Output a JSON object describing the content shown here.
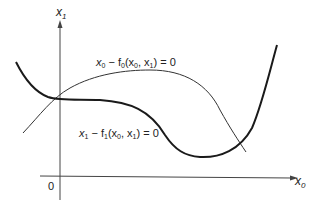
{
  "diagram": {
    "axes": {
      "y_label": "x",
      "y_label_sub": "1",
      "x_label": "x",
      "x_label_sub": "0",
      "origin_label": "0"
    },
    "curves": [
      {
        "name": "f0-curve",
        "style": "thin",
        "label_parts": [
          "x",
          "0",
          " − f",
          "0",
          "(x",
          "0",
          ", x",
          "1",
          ") = 0"
        ]
      },
      {
        "name": "f1-curve",
        "style": "thick",
        "label_parts": [
          "x",
          "1",
          " − f",
          "1",
          "(x",
          "0",
          ", x",
          "1",
          ") = 0"
        ]
      }
    ],
    "colors": {
      "line": "#222222",
      "background": "#ffffff"
    }
  }
}
